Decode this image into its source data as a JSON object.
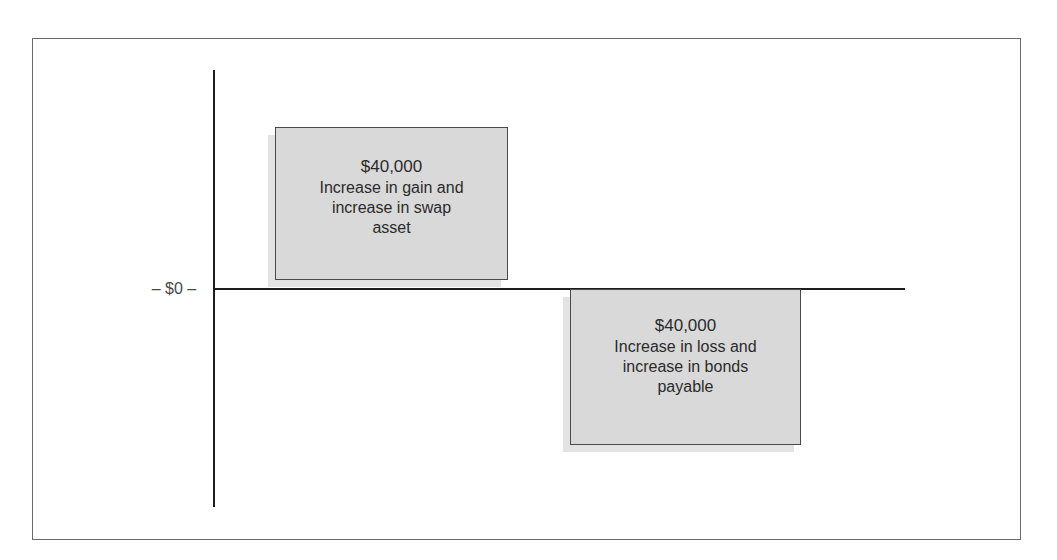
{
  "diagram": {
    "axis": {
      "zero_label": "– $0 –"
    },
    "boxes": [
      {
        "position": "above-axis",
        "amount": "$40,000",
        "lines": [
          "Increase in gain and",
          "increase in swap",
          "asset"
        ]
      },
      {
        "position": "below-axis",
        "amount": "$40,000",
        "lines": [
          "Increase in loss and",
          "increase in bonds",
          "payable"
        ]
      }
    ],
    "colors": {
      "box_fill": "#d9d9d9",
      "box_border": "#4a4a4a",
      "axis": "#1e1e1e",
      "frame": "#6a6a6a"
    }
  }
}
